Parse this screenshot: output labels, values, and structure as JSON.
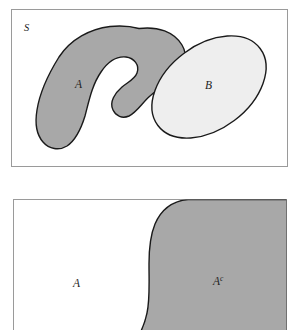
{
  "figure": {
    "title": "",
    "background_color": "#ffffff",
    "panels": [
      {
        "id": "panel-sets",
        "name": "sets-venn-panel",
        "frame": {
          "x": 11,
          "y": 9,
          "width": 277,
          "height": 158,
          "stroke": "#9a9a9a",
          "fill": "#ffffff"
        },
        "labels": {
          "universe": "S",
          "set_a": "A",
          "set_b": "B"
        },
        "regions": [
          {
            "name": "set-a-region",
            "label": "A",
            "fill": "#a8a8a8",
            "stroke": "#1a1a1a"
          },
          {
            "name": "set-b-region",
            "label": "B",
            "fill": "#eeeeee",
            "stroke": "#1a1a1a"
          }
        ]
      },
      {
        "id": "panel-complement",
        "name": "complement-panel",
        "frame": {
          "x": 13,
          "y": 199,
          "width": 274,
          "height": 131,
          "stroke": "#9a9a9a",
          "fill": "#ffffff"
        },
        "labels": {
          "set_a": "A",
          "set_a_complement_base": "A",
          "set_a_complement_sup": "c"
        },
        "regions": [
          {
            "name": "set-a-region",
            "label": "A",
            "fill": "#ffffff",
            "stroke": "none"
          },
          {
            "name": "set-a-complement-region",
            "label": "Ac",
            "fill": "#a8a8a8",
            "stroke": "#1a1a1a"
          }
        ]
      }
    ],
    "colors": {
      "shaded_gray": "#a8a8a8",
      "light_gray": "#eeeeee",
      "outline": "#1a1a1a",
      "frame": "#9a9a9a",
      "text": "#232323"
    },
    "label_positions": {
      "universe_s": {
        "x": 24,
        "y": 30
      },
      "set_a_top": {
        "x": 78,
        "y": 86
      },
      "set_b_top": {
        "x": 208,
        "y": 87
      },
      "set_a_bottom": {
        "x": 76,
        "y": 285
      },
      "set_ac_bottom": {
        "x": 215,
        "y": 283
      }
    }
  }
}
